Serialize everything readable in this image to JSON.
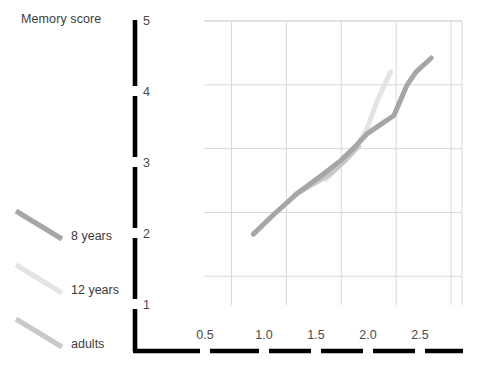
{
  "chart_data": {
    "type": "line",
    "title": "",
    "xlabel": "",
    "ylabel": "Memory score",
    "xlim": [
      0.25,
      2.6
    ],
    "ylim": [
      0.55,
      5.0
    ],
    "grid": true,
    "legend_position": "left",
    "x_ticks": [
      "0.5",
      "1.0",
      "1.5",
      "2.0",
      "2.5"
    ],
    "x_tick_values": [
      0.5,
      1.0,
      1.5,
      2.0,
      2.5
    ],
    "y_ticks": [
      "1",
      "2",
      "3",
      "4",
      "5"
    ],
    "y_tick_values": [
      1,
      2,
      3,
      4,
      5
    ],
    "series": [
      {
        "name": "8 years",
        "color": "#a6a6a6",
        "points": [
          [
            0.7,
            1.66
          ],
          [
            0.88,
            1.96
          ],
          [
            1.1,
            2.3
          ],
          [
            1.32,
            2.58
          ],
          [
            1.5,
            2.82
          ],
          [
            1.62,
            3.02
          ],
          [
            1.74,
            3.24
          ],
          [
            1.86,
            3.38
          ],
          [
            1.98,
            3.52
          ],
          [
            2.1,
            4.0
          ],
          [
            2.18,
            4.2
          ],
          [
            2.32,
            4.42
          ]
        ]
      },
      {
        "name": "12 years",
        "color": "#e4e4e4",
        "points": [
          [
            1.36,
            2.52
          ],
          [
            1.52,
            2.82
          ],
          [
            1.64,
            3.02
          ],
          [
            1.74,
            3.34
          ],
          [
            1.84,
            3.8
          ],
          [
            1.95,
            4.2
          ]
        ]
      },
      {
        "name": "adults",
        "color": "#c9c9c9",
        "points": [
          [
            1.08,
            2.28
          ],
          [
            1.26,
            2.46
          ],
          [
            1.4,
            2.6
          ],
          [
            1.54,
            2.82
          ],
          [
            1.66,
            3.04
          ]
        ]
      }
    ]
  },
  "legend": {
    "items": [
      {
        "label": "8 years",
        "color": "#a6a6a6"
      },
      {
        "label": "12 years",
        "color": "#e4e4e4"
      },
      {
        "label": "adults",
        "color": "#c9c9c9"
      }
    ]
  },
  "axis": {
    "y_title": "Memory score",
    "axis_color": "#000000",
    "grid_color": "#d8d8d8"
  }
}
